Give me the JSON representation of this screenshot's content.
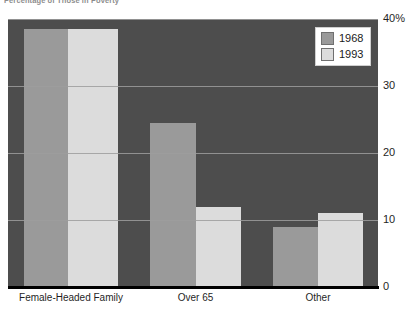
{
  "chart_data": {
    "type": "bar",
    "title": "Percentage of Those in Poverty",
    "xlabel": "",
    "ylabel": "",
    "categories": [
      "Female-Headed Family",
      "Over 65",
      "Other"
    ],
    "series": [
      {
        "name": "1968",
        "color": "#9a9a9a",
        "values": [
          38.5,
          24.5,
          9
        ]
      },
      {
        "name": "1993",
        "color": "#dcdcdc",
        "values": [
          38.5,
          12,
          11
        ]
      }
    ],
    "ylim": [
      0,
      40
    ],
    "yticks": [
      0,
      10,
      20,
      30,
      40
    ],
    "ytick_labels": [
      "0",
      "10",
      "20",
      "30",
      "40%"
    ],
    "grid": true,
    "legend_position": "top-right",
    "plot_background": "#4d4d4d",
    "page_background": "#ffffff"
  },
  "legend": {
    "entries": [
      {
        "label": "1968"
      },
      {
        "label": "1993"
      }
    ]
  }
}
